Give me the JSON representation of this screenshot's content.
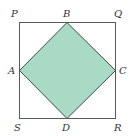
{
  "diagram": {
    "outer_square": {
      "vertices": [
        "P",
        "Q",
        "R",
        "S"
      ]
    },
    "inner_square": {
      "vertices": [
        "A",
        "B",
        "C",
        "D"
      ],
      "description": "Square ABCD formed by joining midpoints of sides of square PQRS, shaded"
    },
    "labels": {
      "P": "P",
      "Q": "Q",
      "R": "R",
      "S": "S",
      "A": "A",
      "B": "B",
      "C": "C",
      "D": "D"
    },
    "colors": {
      "fill": "#a9dac6",
      "outer_stroke": "#5a5a5a",
      "inner_stroke": "#3f4a45"
    }
  }
}
